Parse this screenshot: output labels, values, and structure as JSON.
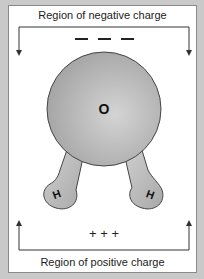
{
  "diagram": {
    "top_label": "Region of negative charge",
    "bottom_label": "Region of positive charge",
    "negative_symbols": "— — —",
    "positive_symbols": "+ + +",
    "atoms": {
      "oxygen": "O",
      "hydrogen_left": "H",
      "hydrogen_right": "H"
    },
    "colors": {
      "background": "#c9c9c9",
      "panel": "#ffffff",
      "molecule": "#b8b8b8",
      "outline": "#444444"
    }
  }
}
